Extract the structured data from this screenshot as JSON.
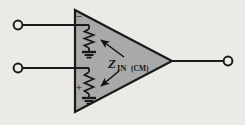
{
  "figure": {
    "kind": "op-amp-common-mode-input-impedance-schematic",
    "background_color": "#eceae6",
    "line_color": "#1a1a1a"
  },
  "amplifier": {
    "name": "operational-amplifier",
    "shape": "triangle",
    "fill_color": "#a9a9a9",
    "stroke_color": "#1a1a1a",
    "apex_x": 172,
    "apex_y": 61,
    "left_x": 75,
    "top_y": 10,
    "bottom_y": 112
  },
  "inputs": [
    {
      "id": "inverting-input",
      "polarity_sign": "−",
      "terminal_x": 18,
      "terminal_y": 25,
      "wire_y": 25,
      "wire_end_x": 89
    },
    {
      "id": "noninverting-input",
      "polarity_sign": "+",
      "terminal_x": 18,
      "terminal_y": 68,
      "wire_y": 68,
      "wire_end_x": 89
    }
  ],
  "output": {
    "id": "output-terminal",
    "terminal_x": 228,
    "terminal_y": 61,
    "wire_start_x": 172
  },
  "impedances": [
    {
      "id": "common-mode-impedance-inverting",
      "element": "resistor",
      "x": 89,
      "top_y": 29,
      "bottom_y": 48,
      "ground_y": 52
    },
    {
      "id": "common-mode-impedance-noninverting",
      "element": "resistor",
      "x": 89,
      "top_y": 72,
      "bottom_y": 94,
      "ground_y": 98
    }
  ],
  "label": {
    "id": "z-in-cm-label",
    "symbol": "Z",
    "subscript": "IN",
    "qualifier": "(CM)",
    "full_text": "Z IN (CM)",
    "x": 112,
    "y": 66
  },
  "annotations": {
    "leader_arrows": [
      {
        "id": "leader-arrow-upper",
        "from_x": 124,
        "from_y": 58,
        "to_x": 100,
        "to_y": 40,
        "points_to": "common-mode-impedance-inverting"
      },
      {
        "id": "leader-arrow-lower",
        "from_x": 118,
        "from_y": 70,
        "to_x": 100,
        "to_y": 86,
        "points_to": "common-mode-impedance-noninverting"
      }
    ]
  }
}
